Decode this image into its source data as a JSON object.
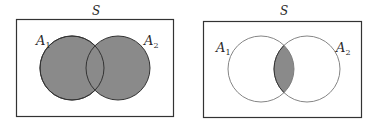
{
  "diagrams": [
    {
      "id": "union",
      "universe_label": "S",
      "set1_label": "A",
      "set1_sub": "1",
      "set2_label": "A",
      "set2_sub": "2",
      "shaded_region": "A1 ∪ A2"
    },
    {
      "id": "intersection",
      "universe_label": "S",
      "set1_label": "A",
      "set1_sub": "1",
      "set2_label": "A",
      "set2_sub": "2",
      "shaded_region": "A1 ∩ A2"
    }
  ],
  "colors": {
    "shade": "#8a8a8a",
    "stroke": "#333333",
    "light_stroke": "#777777",
    "background": "#ffffff"
  }
}
